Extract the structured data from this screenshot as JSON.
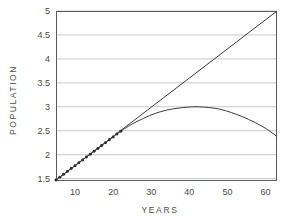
{
  "chart_data": {
    "type": "line",
    "title": "",
    "xlabel": "YEARS",
    "ylabel": "POPULATION",
    "xlim": [
      5,
      63
    ],
    "ylim": [
      1.45,
      5.0
    ],
    "grid": true,
    "legend": false,
    "xticks": [
      10,
      20,
      30,
      40,
      50,
      60
    ],
    "yticks": [
      1.5,
      2,
      2.5,
      3,
      3.5,
      4,
      4.5,
      5
    ],
    "xtick_labels": [
      "10",
      "20",
      "30",
      "40",
      "50",
      "60"
    ],
    "ytick_labels": [
      "1.5",
      "2",
      "2.5",
      "3",
      "3.5",
      "4",
      "4.5",
      "5"
    ],
    "series": [
      {
        "name": "observed-data-points",
        "style": "markers",
        "marker": "dot",
        "color": "#1a1a1a",
        "x": [
          5,
          6,
          7,
          8,
          9,
          10,
          11,
          12,
          13,
          14,
          15,
          16,
          17,
          18,
          19,
          20,
          21,
          22
        ],
        "y": [
          1.47,
          1.53,
          1.59,
          1.65,
          1.71,
          1.77,
          1.83,
          1.89,
          1.95,
          2.01,
          2.07,
          2.13,
          2.19,
          2.25,
          2.31,
          2.37,
          2.43,
          2.49
        ]
      },
      {
        "name": "linear-extrapolation",
        "style": "line",
        "color": "#3a3a3a",
        "x": [
          5,
          63
        ],
        "y": [
          1.47,
          5.0
        ]
      },
      {
        "name": "logistic-saturating-curve",
        "style": "line",
        "color": "#3a3a3a",
        "x": [
          5,
          10,
          15,
          20,
          22,
          25,
          28,
          31,
          34,
          37,
          40,
          42,
          45,
          48,
          51,
          54,
          57,
          60,
          63
        ],
        "y": [
          1.47,
          1.77,
          2.07,
          2.37,
          2.49,
          2.64,
          2.76,
          2.86,
          2.93,
          2.97,
          2.995,
          3.0,
          2.985,
          2.95,
          2.88,
          2.79,
          2.68,
          2.55,
          2.38
        ]
      }
    ],
    "colors": {
      "axis": "#5a5a5a",
      "grid": "#c9c9c9",
      "curve": "#3a3a3a",
      "markers": "#1a1a1a",
      "background": "#ffffff",
      "text": "#4a4a4a"
    },
    "plot_area": {
      "left": 56,
      "top": 11,
      "right": 277,
      "bottom": 181
    }
  }
}
